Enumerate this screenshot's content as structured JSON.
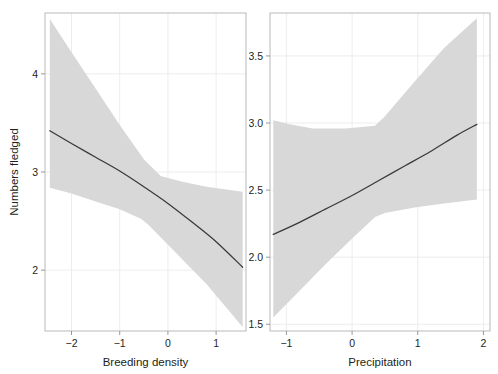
{
  "figure": {
    "type": "multi-panel-regression-plot",
    "panel_count": 2,
    "background_color": "#ffffff",
    "band_color": "#d8d8d8",
    "line_color": "#3a3a3a",
    "frame_color": "#b9b9bb",
    "grid_color": "#e9e9ec"
  },
  "chart_data": [
    {
      "type": "line",
      "panel": "left",
      "title": "",
      "xlabel": "Breeding density",
      "ylabel": "Numbers fledged",
      "xlim": [
        -2.55,
        1.62
      ],
      "ylim": [
        1.38,
        4.62
      ],
      "xticks": [
        -2,
        -1,
        0,
        1
      ],
      "xtick_labels": [
        "−2",
        "−1",
        "0",
        "1"
      ],
      "yticks": [
        2,
        3,
        4
      ],
      "ytick_labels": [
        "2",
        "3",
        "4"
      ],
      "grid": true,
      "legend": "none",
      "series": [
        {
          "name": "fitted",
          "x": [
            -2.45,
            -2.0,
            -1.5,
            -1.0,
            -0.5,
            0.0,
            0.5,
            1.0,
            1.55
          ],
          "values": [
            3.42,
            3.29,
            3.15,
            3.01,
            2.85,
            2.68,
            2.49,
            2.29,
            2.03
          ]
        },
        {
          "name": "ci-upper",
          "x": [
            -2.45,
            -2.0,
            -1.5,
            -1.0,
            -0.5,
            -0.15,
            0.3,
            0.8,
            1.55
          ],
          "values": [
            4.56,
            4.22,
            3.85,
            3.48,
            3.13,
            2.96,
            2.9,
            2.85,
            2.8
          ]
        },
        {
          "name": "ci-lower",
          "x": [
            -2.45,
            -2.0,
            -1.5,
            -1.0,
            -0.55,
            -0.4,
            0.2,
            0.8,
            1.55
          ],
          "values": [
            2.84,
            2.78,
            2.7,
            2.62,
            2.52,
            2.46,
            2.16,
            1.86,
            1.42
          ]
        }
      ]
    },
    {
      "type": "line",
      "panel": "right",
      "title": "",
      "xlabel": "Precipitation",
      "ylabel": "",
      "xlim": [
        -1.25,
        2.1
      ],
      "ylim": [
        1.45,
        3.82
      ],
      "xticks": [
        -1,
        0,
        1,
        2
      ],
      "xtick_labels": [
        "−1",
        "0",
        "1",
        "2"
      ],
      "yticks": [
        1.5,
        2.0,
        2.5,
        3.0,
        3.5
      ],
      "ytick_labels": [
        "1.5",
        "2.0",
        "2.5",
        "3.0",
        "3.5"
      ],
      "grid": true,
      "legend": "none",
      "series": [
        {
          "name": "fitted",
          "x": [
            -1.2,
            -0.8,
            -0.4,
            0.0,
            0.4,
            0.8,
            1.2,
            1.6,
            1.9
          ],
          "values": [
            2.17,
            2.26,
            2.36,
            2.46,
            2.57,
            2.68,
            2.79,
            2.91,
            2.99
          ]
        },
        {
          "name": "ci-upper",
          "x": [
            -1.2,
            -0.95,
            -0.6,
            -0.1,
            0.35,
            0.5,
            0.9,
            1.4,
            1.9
          ],
          "values": [
            3.02,
            2.99,
            2.96,
            2.96,
            2.98,
            3.05,
            3.28,
            3.56,
            3.78
          ]
        },
        {
          "name": "ci-lower",
          "x": [
            -1.2,
            -0.8,
            -0.4,
            0.0,
            0.35,
            0.5,
            0.95,
            1.4,
            1.9
          ],
          "values": [
            1.55,
            1.75,
            1.95,
            2.14,
            2.3,
            2.33,
            2.37,
            2.4,
            2.43
          ]
        }
      ]
    }
  ],
  "axes": {
    "left": {
      "xlabel": "Breeding density",
      "ylabel": "Numbers fledged",
      "xtick_labels": [
        "−2",
        "−1",
        "0",
        "1"
      ],
      "ytick_labels": [
        "4",
        "3",
        "2"
      ]
    },
    "right": {
      "xlabel": "Precipitation",
      "ylabel": "",
      "xtick_labels": [
        "−1",
        "0",
        "1",
        "2"
      ],
      "ytick_labels": [
        "3.5",
        "3.0",
        "2.5",
        "2.0",
        "1.5"
      ]
    }
  }
}
